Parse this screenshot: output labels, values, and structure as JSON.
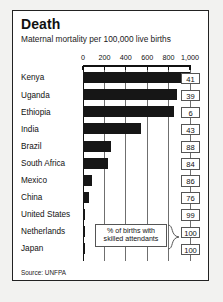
{
  "card": {
    "title": "Death",
    "subtitle": "Maternal mortality per 100,000 live births",
    "source": "Source: UNFPA"
  },
  "legend": {
    "line1": "% of births with",
    "line2": "skilled attendants"
  },
  "colors": {
    "bar": "#161616",
    "frame": "#222222",
    "grid": "#6f6f6f",
    "page_background": "#f2f2f0",
    "card_background": "#ffffff",
    "box_border": "#555555"
  },
  "chart_data": {
    "type": "bar",
    "orientation": "horizontal",
    "title": "Death",
    "subtitle": "Maternal mortality per 100,000 live births",
    "xlabel": "",
    "ylabel": "",
    "xlim": [
      0,
      1000
    ],
    "xticks": [
      0,
      200,
      400,
      600,
      800,
      1000
    ],
    "xtick_labels": [
      "0",
      "200",
      "400",
      "600",
      "800",
      "1,000"
    ],
    "grid": true,
    "legend_position": "bottom-right",
    "categories": [
      "Kenya",
      "Uganda",
      "Ethiopia",
      "India",
      "Brazil",
      "South Africa",
      "Mexico",
      "China",
      "United States",
      "Netherlands",
      "Japan"
    ],
    "series": [
      {
        "name": "Maternal mortality per 100,000 live births",
        "values": [
          1000,
          880,
          850,
          540,
          260,
          230,
          83,
          56,
          17,
          7,
          10
        ]
      },
      {
        "name": "% of births with skilled attendants",
        "values": [
          41,
          39,
          6,
          43,
          88,
          84,
          86,
          76,
          99,
          100,
          100
        ]
      }
    ]
  }
}
